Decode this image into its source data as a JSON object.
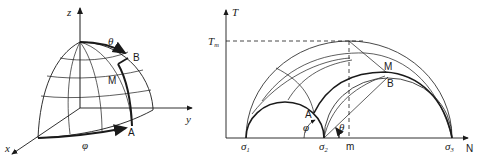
{
  "left_figure": {
    "description": "Octant of unit sphere with spherical coordinates",
    "axes": {
      "z": "z",
      "y": "y",
      "x": "x"
    },
    "points": {
      "A": "A",
      "B": "B",
      "M": "M"
    },
    "angles": {
      "theta": "θ",
      "phi": "φ"
    }
  },
  "right_figure": {
    "description": "Mohr circle diagram (normal vs shear stress)",
    "axes": {
      "vertical": "T",
      "horizontal": "N"
    },
    "tm_label": "T",
    "tm_sub": "m",
    "m_label": "m",
    "sigmas": [
      {
        "base": "σ",
        "sub": "1"
      },
      {
        "base": "σ",
        "sub": "2"
      },
      {
        "base": "σ",
        "sub": "3"
      }
    ],
    "points": {
      "A": "A",
      "B": "B",
      "M": "M"
    },
    "angles": {
      "theta": "θ",
      "phi": "φ"
    }
  }
}
